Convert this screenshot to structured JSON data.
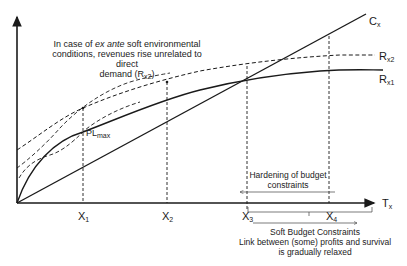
{
  "diagram": {
    "title_annotation": {
      "line1_pre": "In case of ",
      "line1_italic": "ex ante",
      "line1_post": " soft environmental",
      "line2": "conditions, revenues rise unrelated to direct",
      "line3_pre": "demand (R",
      "line3_sub": "x2",
      "line3_post": ")"
    },
    "curves": {
      "cost": {
        "base": "C",
        "sub": "x"
      },
      "revenue2": {
        "base": "R",
        "sub": "x2"
      },
      "revenue1": {
        "base": "R",
        "sub": "x1"
      }
    },
    "point_label": {
      "base": "PL",
      "sub": "max"
    },
    "x_axis": {
      "base": "T",
      "sub": "x"
    },
    "x_ticks": [
      {
        "base": "X",
        "sub": "1"
      },
      {
        "base": "X",
        "sub": "2"
      },
      {
        "base": "X",
        "sub": "3"
      },
      {
        "base": "X",
        "sub": "4"
      }
    ],
    "hardening_annotation": {
      "line1": "Hardening of budget",
      "line2": "constraints"
    },
    "soft_annotation": {
      "line1": "Soft Budget Constraints",
      "line2": "Link between (some) profits and survival",
      "line3": "is gradually relaxed"
    },
    "colors": {
      "line": "#1a1a1a",
      "text": "#222222",
      "background": "#ffffff"
    }
  }
}
